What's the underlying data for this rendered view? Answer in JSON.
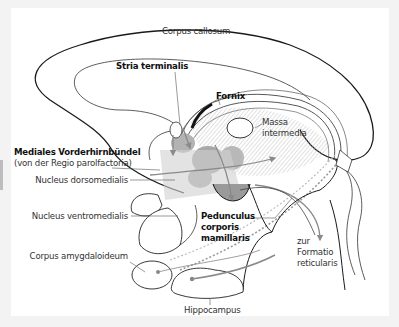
{
  "figure": {
    "background": "#ffffff",
    "outline_color": "#1a1a1a",
    "gray_fill": "#a8a8a8",
    "light_gray_fill": "#d0d0d0",
    "arrow_color": "#8a8a8a"
  },
  "labels": {
    "corpus_callosum": "Corpus callosum",
    "stria_terminalis": "Stria terminalis",
    "fornix": "Fornix",
    "massa_intermedia_1": "Massa",
    "massa_intermedia_2": "intermedia",
    "mediales_vorderhirnbuendel": "Mediales Vorderhirnbündel",
    "regio_parolfactoria": "(von der Regio parolfactoria)",
    "nucleus_dorsomedialis": "Nucleus dorsomedialis",
    "nucleus_ventromedialis": "Nucleus ventromedialis",
    "pedunculus_1": "Pedunculus",
    "pedunculus_2": "corporis",
    "pedunculus_3": "mamillaris",
    "zur_1": "zur",
    "zur_2": "Formatio",
    "zur_3": "reticularis",
    "corpus_amygdaloideum": "Corpus amygdaloideum",
    "hippocampus": "Hippocampus"
  }
}
